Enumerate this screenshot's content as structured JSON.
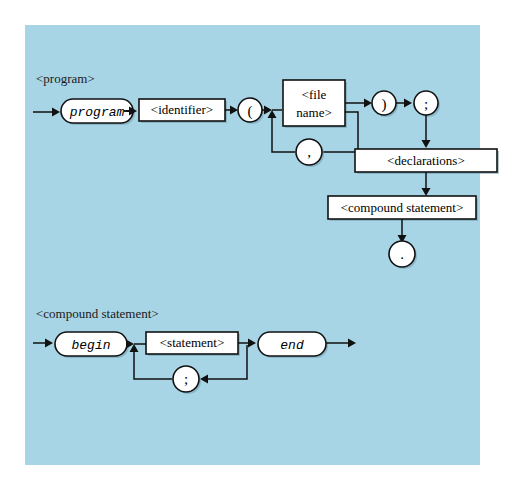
{
  "figure": {
    "kind": "syntax-railroad-diagram",
    "background_color": "#ffffff",
    "panel_color": "#a8d5e5",
    "line_color": "#111111",
    "node_fill": "#ffffff",
    "productions": [
      {
        "id": "program",
        "label": "<program>",
        "nodes": [
          {
            "id": "program-keyword",
            "shape": "oval",
            "text": "program",
            "style": "terminal"
          },
          {
            "id": "identifier",
            "shape": "box",
            "text": "<identifier>",
            "style": "nonterminal"
          },
          {
            "id": "open-paren",
            "shape": "circle",
            "text": "(",
            "style": "terminal"
          },
          {
            "id": "file-name",
            "shape": "box",
            "text_line1": "<file",
            "text_line2": "name>",
            "style": "nonterminal"
          },
          {
            "id": "comma",
            "shape": "circle",
            "text": ",",
            "style": "terminal"
          },
          {
            "id": "close-paren",
            "shape": "circle",
            "text": ")",
            "style": "terminal"
          },
          {
            "id": "semicolon",
            "shape": "circle",
            "text": ";",
            "style": "terminal"
          },
          {
            "id": "declarations",
            "shape": "box",
            "text": "<declarations>",
            "style": "nonterminal"
          },
          {
            "id": "compound-statement-ref",
            "shape": "box",
            "text": "<compound statement>",
            "style": "nonterminal"
          },
          {
            "id": "period",
            "shape": "circle",
            "text": ".",
            "style": "terminal"
          }
        ]
      },
      {
        "id": "compound-statement",
        "label": "<compound statement>",
        "nodes": [
          {
            "id": "begin-keyword",
            "shape": "oval",
            "text": "begin",
            "style": "terminal"
          },
          {
            "id": "statement",
            "shape": "box",
            "text": "<statement>",
            "style": "nonterminal"
          },
          {
            "id": "statement-separator",
            "shape": "circle",
            "text": ";",
            "style": "terminal"
          },
          {
            "id": "end-keyword",
            "shape": "oval",
            "text": "end",
            "style": "terminal"
          }
        ]
      }
    ]
  }
}
